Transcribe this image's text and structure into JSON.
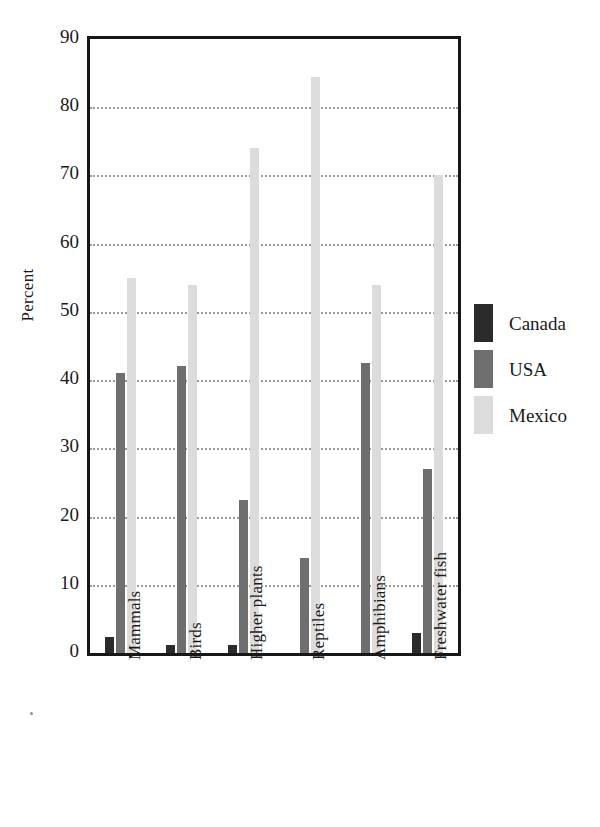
{
  "chart_data": {
    "type": "bar",
    "title": "",
    "xlabel": "",
    "ylabel": "Percent",
    "ylim": [
      0,
      90
    ],
    "ytick_step": 10,
    "yticks": [
      90,
      80,
      70,
      60,
      50,
      40,
      30,
      20,
      10,
      0
    ],
    "grid": true,
    "grid_axis": "y",
    "legend_position": "right",
    "categories": [
      "Mammals",
      "Birds",
      "Higher plants",
      "Reptiles",
      "Amphibians",
      "Freshwater fish"
    ],
    "series": [
      {
        "name": "Canada",
        "color": "#2b2b2b",
        "values": [
          2.3,
          1.2,
          1.2,
          0,
          0,
          3
        ]
      },
      {
        "name": "USA",
        "color": "#6e6e6e",
        "values": [
          41,
          42,
          22.5,
          14,
          42.5,
          27
        ]
      },
      {
        "name": "Mexico",
        "color": "#dcdcdc",
        "values": [
          55,
          54,
          74,
          84.5,
          54,
          70
        ]
      }
    ]
  },
  "axis": {
    "y_title": "Percent",
    "y_tick_labels": [
      "90",
      "80",
      "70",
      "60",
      "50",
      "40",
      "30",
      "20",
      "10",
      "0"
    ]
  },
  "legend": {
    "items": [
      {
        "label": "Canada",
        "color": "#2b2b2b"
      },
      {
        "label": "USA",
        "color": "#6e6e6e"
      },
      {
        "label": "Mexico",
        "color": "#dcdcdc"
      }
    ]
  },
  "x_axis": {
    "labels": [
      "Mammals",
      "Birds",
      "Higher plants",
      "Reptiles",
      "Amphibians",
      "Freshwater fish"
    ]
  }
}
